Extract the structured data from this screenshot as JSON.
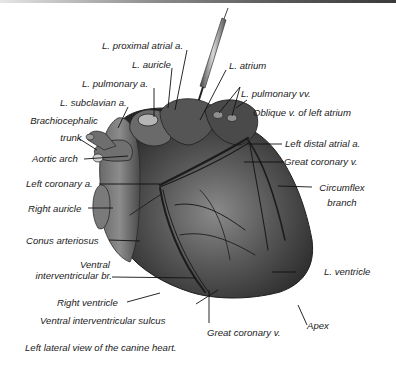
{
  "figure": {
    "caption": "Left lateral view of the canine heart.",
    "colors": {
      "background": "#ffffff",
      "heart_dark": "#2b2b2b",
      "heart_mid": "#5c5c5c",
      "heart_light": "#9a9a9a",
      "vessel": "#1c1c1c",
      "text": "#1a1a1a"
    }
  },
  "labels": {
    "l_proximal_atrial_a": "L. proximal atrial a.",
    "l_auricle": "L. auricle",
    "l_atrium": "L. atrium",
    "l_pulmonary_a": "L. pulmonary a.",
    "l_pulmonary_vv": "L. pulmonary vv.",
    "l_subclavian_a": "L. subclavian a.",
    "oblique_v": "Oblique v. of left atrium",
    "brachiocephalic_1": "Brachiocephalic",
    "brachiocephalic_2": "trunk",
    "left_distal_atrial_a": "Left distal atrial a.",
    "aortic_arch": "Aortic arch",
    "great_coronary_v_upper": "Great coronary v.",
    "left_coronary_a": "Left coronary a.",
    "circumflex_1": "Circumflex",
    "circumflex_2": "branch",
    "right_auricle": "Right auricle",
    "conus_arteriosus": "Conus arteriosus",
    "ventral_ivb_1": "Ventral",
    "ventral_ivb_2": "interventricular br.",
    "l_ventricle": "L. ventricle",
    "right_ventricle": "Right ventricle",
    "apex": "Apex",
    "ventral_iv_sulcus": "Ventral interventricular sulcus",
    "great_coronary_v_lower": "Great coronary v."
  }
}
